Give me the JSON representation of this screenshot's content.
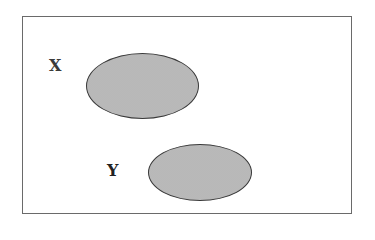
{
  "diagram": {
    "type": "disjoint-sets",
    "frame": {
      "label": ""
    },
    "sets": [
      {
        "id": "x",
        "label": "X",
        "fill": "#bdbdbd",
        "stroke": "#3a3a3a"
      },
      {
        "id": "y",
        "label": "Y",
        "fill": "#bdbdbd",
        "stroke": "#3a3a3a"
      }
    ]
  }
}
